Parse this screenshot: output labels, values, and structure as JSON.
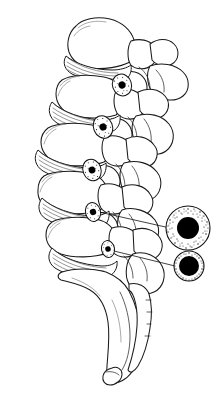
{
  "figure": {
    "view": "lateral",
    "orientation": "anterior-left-posterior-right",
    "background_color": "#ffffff",
    "line_color": "#1a1a1a",
    "fill_color": "#000000",
    "stipple_color": "#111111",
    "width": 224,
    "height": 404
  },
  "vertebrae": [
    {
      "index": 0,
      "name": "vertebra-l1",
      "body_center": [
        95,
        45
      ],
      "body_width": 62,
      "body_height": 42
    },
    {
      "index": 1,
      "name": "vertebra-l2",
      "body_center": [
        85,
        100
      ],
      "body_width": 66,
      "body_height": 42
    },
    {
      "index": 2,
      "name": "vertebra-l3",
      "body_center": [
        72,
        148
      ],
      "body_width": 70,
      "body_height": 40
    },
    {
      "index": 3,
      "name": "vertebra-l4",
      "body_center": [
        70,
        196
      ],
      "body_width": 70,
      "body_height": 40
    },
    {
      "index": 4,
      "name": "vertebra-l5",
      "body_center": [
        78,
        240
      ],
      "body_width": 68,
      "body_height": 36
    }
  ],
  "discs": [
    {
      "index": 0,
      "name": "disc-l1-l2",
      "center": [
        92,
        72
      ],
      "label": "intervertebral-disc"
    },
    {
      "index": 1,
      "name": "disc-l2-l3",
      "center": [
        82,
        122
      ],
      "label": "intervertebral-disc"
    },
    {
      "index": 2,
      "name": "disc-l3-l4",
      "center": [
        72,
        172
      ],
      "label": "intervertebral-disc"
    },
    {
      "index": 3,
      "name": "disc-l4-l5",
      "center": [
        74,
        218
      ],
      "label": "intervertebral-disc"
    },
    {
      "index": 4,
      "name": "disc-l5-s1",
      "center": [
        84,
        262
      ],
      "label": "lumbosacral-disc"
    }
  ],
  "foramina": [
    {
      "index": 0,
      "name": "foramen-marker-1",
      "cx": 122,
      "cy": 85,
      "rx": 9.5,
      "ry": 11.0,
      "core_r": 3.6,
      "rotation": -18
    },
    {
      "index": 1,
      "name": "foramen-marker-2",
      "cx": 103,
      "cy": 127,
      "rx": 9.5,
      "ry": 11.5,
      "core_r": 3.6,
      "rotation": -22
    },
    {
      "index": 2,
      "name": "foramen-marker-3",
      "cx": 92,
      "cy": 170,
      "rx": 9.0,
      "ry": 11.0,
      "core_r": 3.4,
      "rotation": -20
    },
    {
      "index": 3,
      "name": "foramen-marker-4",
      "cx": 93,
      "cy": 212,
      "rx": 7.5,
      "ry": 9.5,
      "core_r": 3.2,
      "rotation": -14
    },
    {
      "index": 4,
      "name": "foramen-marker-5",
      "cx": 108,
      "cy": 249,
      "rx": 6.5,
      "ry": 8.5,
      "core_r": 2.8,
      "rotation": -10
    }
  ],
  "leaders": [
    {
      "index": 0,
      "name": "leader-line-upper",
      "from": [
        99,
        212
      ],
      "to": [
        170,
        228
      ]
    },
    {
      "index": 1,
      "name": "leader-line-lower",
      "from": [
        114,
        251
      ],
      "to": [
        175,
        266
      ]
    }
  ],
  "insets": [
    {
      "index": 0,
      "name": "inset-foramen-normal",
      "cx": 188,
      "cy": 228,
      "outer_r": 22.0,
      "core_r": 11.0,
      "stipple_count": 150,
      "description": "normal-intervertebral-foramen-cross-section"
    },
    {
      "index": 1,
      "name": "inset-foramen-narrowed",
      "cx": 189,
      "cy": 266,
      "outer_r": 15.0,
      "core_r": 10.0,
      "stipple_count": 80,
      "description": "narrowed-stenotic-foramen-cross-section"
    }
  ],
  "sacrum": {
    "name": "sacrum",
    "apex": [
      120,
      300
    ],
    "label": "sacrum"
  },
  "coccyx": {
    "name": "coccyx",
    "tip": [
      110,
      378
    ],
    "label": "coccyx"
  }
}
